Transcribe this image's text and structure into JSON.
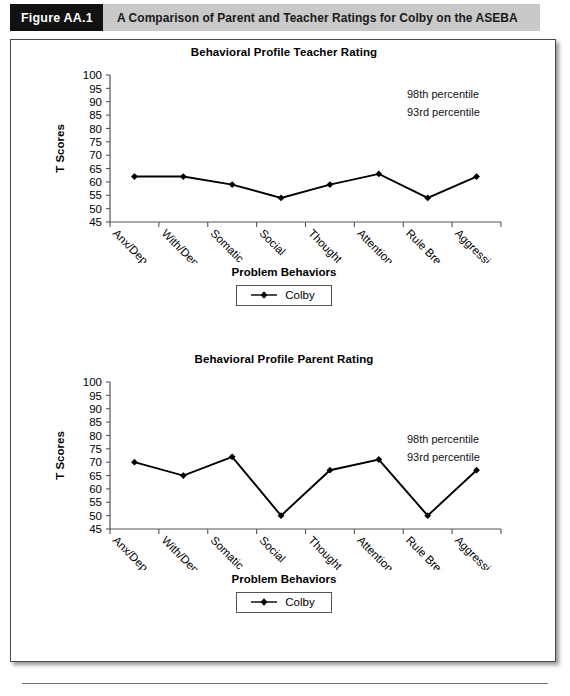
{
  "figure": {
    "badge": "Figure AA.1",
    "caption": "A Comparison of Parent and Teacher Ratings for Colby on the ASEBA"
  },
  "charts": [
    {
      "title": "Behavioral Profile Teacher Rating",
      "ylabel": "T Scores",
      "xlabel": "Problem Behaviors",
      "legend_label": "Colby",
      "annotations": [
        "98th percentile",
        "93rd percentile"
      ]
    },
    {
      "title": "Behavioral Profile Parent Rating",
      "ylabel": "T Scores",
      "xlabel": "Problem Behaviors",
      "legend_label": "Colby",
      "annotations": [
        "98th percentile",
        "93rd percentile"
      ]
    }
  ],
  "chart_data": [
    {
      "type": "line",
      "title": "Behavioral Profile Teacher Rating",
      "xlabel": "Problem Behaviors",
      "ylabel": "T Scores",
      "categories": [
        "Anx/Dep",
        "With/Dep",
        "Somatic",
        "Social",
        "Thought",
        "Attention",
        "Rule Break",
        "Aggression"
      ],
      "ylim": [
        45,
        100
      ],
      "yticks": [
        45,
        50,
        55,
        60,
        65,
        70,
        75,
        80,
        85,
        90,
        95,
        100
      ],
      "grid": false,
      "legend_position": "below-axis-label",
      "annotations": [
        "98th percentile",
        "93rd percentile"
      ],
      "series": [
        {
          "name": "Colby",
          "values": [
            62,
            62,
            59,
            54,
            59,
            63,
            54,
            62
          ]
        }
      ]
    },
    {
      "type": "line",
      "title": "Behavioral Profile Parent Rating",
      "xlabel": "Problem Behaviors",
      "ylabel": "T Scores",
      "categories": [
        "Anx/Dep",
        "With/Dep",
        "Somatic",
        "Social",
        "Thought",
        "Attention",
        "Rule Break",
        "Aggression"
      ],
      "ylim": [
        45,
        100
      ],
      "yticks": [
        45,
        50,
        55,
        60,
        65,
        70,
        75,
        80,
        85,
        90,
        95,
        100
      ],
      "grid": false,
      "legend_position": "below-axis-label",
      "annotations": [
        "98th percentile",
        "93rd percentile"
      ],
      "series": [
        {
          "name": "Colby",
          "values": [
            70,
            65,
            72,
            50,
            67,
            71,
            50,
            67
          ]
        }
      ]
    }
  ],
  "colors": {
    "caption_bar": "#c9c9c9",
    "badge_bg": "#111111",
    "line": "#000000",
    "panel_border": "#4a4a4a"
  }
}
